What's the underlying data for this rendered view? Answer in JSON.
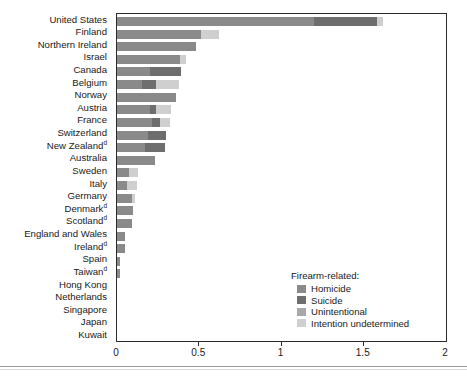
{
  "chart_data": {
    "type": "bar",
    "orientation": "horizontal",
    "stacked": true,
    "title": "",
    "xlabel": "",
    "ylabel": "",
    "xlim": [
      0,
      2
    ],
    "xticks": [
      0,
      0.5,
      1,
      1.5,
      2
    ],
    "xtick_labels": [
      "0",
      "0.5",
      "1",
      "1.5",
      "2"
    ],
    "grid": false,
    "legend_position": "inside-bottom-right",
    "legend_title": "Firearm-related:",
    "series": [
      {
        "name": "Homicide",
        "color": "#8a8a8a"
      },
      {
        "name": "Suicide",
        "color": "#6e6e6e"
      },
      {
        "name": "Unintentional",
        "color": "#a8a8a8"
      },
      {
        "name": "Intention undetermined",
        "color": "#cfcfcf"
      }
    ],
    "categories": [
      "United States",
      "Finland",
      "Northern Ireland",
      "Israel",
      "Canada",
      "Belgium",
      "Norway",
      "Austria",
      "France",
      "Switzerland",
      "New Zealand",
      "Australia",
      "Sweden",
      "Italy",
      "Germany",
      "Denmark",
      "Scotland",
      "England and Wales",
      "Ireland",
      "Spain",
      "Taiwan",
      "Hong Kong",
      "Netherlands",
      "Singapore",
      "Japan",
      "Kuwait"
    ],
    "category_footnotes": {
      "New Zealand": "d",
      "Denmark": "d",
      "Scotland": "d",
      "Ireland": "d",
      "Taiwan": "d"
    },
    "rows": [
      {
        "category": "United States",
        "footnote": "",
        "values": [
          1.2,
          0.38,
          0.0,
          0.04
        ],
        "total": 1.62
      },
      {
        "category": "Finland",
        "footnote": "",
        "values": [
          0.51,
          0.0,
          0.0,
          0.11
        ],
        "total": 0.62
      },
      {
        "category": "Northern Ireland",
        "footnote": "",
        "values": [
          0.48,
          0.0,
          0.0,
          0.0
        ],
        "total": 0.48
      },
      {
        "category": "Israel",
        "footnote": "",
        "values": [
          0.38,
          0.0,
          0.0,
          0.04
        ],
        "total": 0.42
      },
      {
        "category": "Canada",
        "footnote": "",
        "values": [
          0.2,
          0.19,
          0.0,
          0.0
        ],
        "total": 0.39
      },
      {
        "category": "Belgium",
        "footnote": "",
        "values": [
          0.15,
          0.09,
          0.0,
          0.14
        ],
        "total": 0.38
      },
      {
        "category": "Norway",
        "footnote": "",
        "values": [
          0.36,
          0.0,
          0.0,
          0.0
        ],
        "total": 0.36
      },
      {
        "category": "Austria",
        "footnote": "",
        "values": [
          0.2,
          0.04,
          0.0,
          0.09
        ],
        "total": 0.33
      },
      {
        "category": "France",
        "footnote": "",
        "values": [
          0.21,
          0.05,
          0.0,
          0.06
        ],
        "total": 0.32
      },
      {
        "category": "Switzerland",
        "footnote": "",
        "values": [
          0.19,
          0.11,
          0.0,
          0.0
        ],
        "total": 0.3
      },
      {
        "category": "New Zealand",
        "footnote": "d",
        "values": [
          0.17,
          0.12,
          0.0,
          0.0
        ],
        "total": 0.29
      },
      {
        "category": "Australia",
        "footnote": "",
        "values": [
          0.23,
          0.0,
          0.0,
          0.0
        ],
        "total": 0.23
      },
      {
        "category": "Sweden",
        "footnote": "",
        "values": [
          0.07,
          0.0,
          0.0,
          0.06
        ],
        "total": 0.13
      },
      {
        "category": "Italy",
        "footnote": "",
        "values": [
          0.06,
          0.0,
          0.0,
          0.06
        ],
        "total": 0.12
      },
      {
        "category": "Germany",
        "footnote": "",
        "values": [
          0.09,
          0.0,
          0.0,
          0.02
        ],
        "total": 0.11
      },
      {
        "category": "Denmark",
        "footnote": "d",
        "values": [
          0.1,
          0.0,
          0.0,
          0.0
        ],
        "total": 0.1
      },
      {
        "category": "Scotland",
        "footnote": "d",
        "values": [
          0.09,
          0.0,
          0.0,
          0.0
        ],
        "total": 0.09
      },
      {
        "category": "England and Wales",
        "footnote": "",
        "values": [
          0.05,
          0.0,
          0.0,
          0.0
        ],
        "total": 0.05
      },
      {
        "category": "Ireland",
        "footnote": "d",
        "values": [
          0.05,
          0.0,
          0.0,
          0.0
        ],
        "total": 0.05
      },
      {
        "category": "Spain",
        "footnote": "",
        "values": [
          0.02,
          0.0,
          0.0,
          0.0
        ],
        "total": 0.02
      },
      {
        "category": "Taiwan",
        "footnote": "d",
        "values": [
          0.02,
          0.0,
          0.0,
          0.0
        ],
        "total": 0.02
      },
      {
        "category": "Hong Kong",
        "footnote": "",
        "values": [
          0.0,
          0.0,
          0.0,
          0.0
        ],
        "total": 0.0
      },
      {
        "category": "Netherlands",
        "footnote": "",
        "values": [
          0.0,
          0.0,
          0.0,
          0.0
        ],
        "total": 0.0
      },
      {
        "category": "Singapore",
        "footnote": "",
        "values": [
          0.0,
          0.0,
          0.0,
          0.0
        ],
        "total": 0.0
      },
      {
        "category": "Japan",
        "footnote": "",
        "values": [
          0.0,
          0.0,
          0.0,
          0.0
        ],
        "total": 0.0
      },
      {
        "category": "Kuwait",
        "footnote": "",
        "values": [
          0.0,
          0.0,
          0.0,
          0.0
        ],
        "total": 0.0
      }
    ]
  },
  "legend": {
    "title": "Firearm-related:",
    "items": [
      {
        "label": "Homicide",
        "color": "#8a8a8a"
      },
      {
        "label": "Suicide",
        "color": "#6e6e6e"
      },
      {
        "label": "Unintentional",
        "color": "#a8a8a8"
      },
      {
        "label": "Intention undetermined",
        "color": "#cfcfcf"
      }
    ]
  },
  "axis": {
    "tick_labels": [
      "0",
      "0.5",
      "1",
      "1.5",
      "2"
    ],
    "tick_values": [
      0,
      0.5,
      1,
      1.5,
      2
    ]
  },
  "colors": {
    "frame": "#2b2b2b",
    "text": "#1a1a1a",
    "background": "#ffffff"
  }
}
